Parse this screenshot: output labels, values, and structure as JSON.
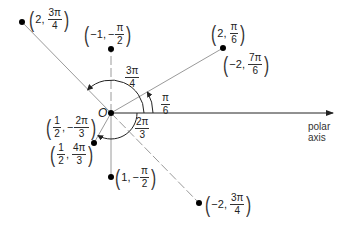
{
  "diagram": {
    "title": "",
    "origin_label": "O",
    "axis_label_line1": "polar",
    "axis_label_line2": "axis",
    "colors": {
      "line": "#9a9a9a",
      "axis": "#222222",
      "point": "#000000",
      "text": "#222222"
    },
    "scale_px_per_unit": 64,
    "points": [
      {
        "id": "p1",
        "r": "2",
        "theta_num": "3π",
        "theta_den": "4",
        "sign": "",
        "polar": [
          2,
          2.356
        ]
      },
      {
        "id": "p2",
        "r": "−1",
        "theta_num": "π",
        "theta_den": "2",
        "sign": "−",
        "polar": [
          -1,
          -1.571
        ]
      },
      {
        "id": "p3",
        "r": "2",
        "theta_num": "π",
        "theta_den": "6",
        "sign": "",
        "polar": [
          2,
          0.524
        ]
      },
      {
        "id": "p3b",
        "r": "−2",
        "theta_num": "7π",
        "theta_den": "6",
        "sign": "",
        "polar": [
          -2,
          3.665
        ]
      },
      {
        "id": "p4",
        "r_num": "1",
        "r_den": "2",
        "theta_num": "2π",
        "theta_den": "3",
        "sign": "−",
        "polar": [
          0.5,
          -2.094
        ]
      },
      {
        "id": "p4b",
        "r_num": "1",
        "r_den": "2",
        "theta_num": "4π",
        "theta_den": "3",
        "sign": "",
        "polar": [
          0.5,
          4.189
        ]
      },
      {
        "id": "p5",
        "r": "1",
        "theta_num": "π",
        "theta_den": "2",
        "sign": "−",
        "polar": [
          1,
          -1.571
        ]
      },
      {
        "id": "p6",
        "r": "−2",
        "theta_num": "3π",
        "theta_den": "4",
        "sign": "",
        "polar": [
          -2,
          2.356
        ]
      }
    ],
    "angle_labels": [
      {
        "id": "a34",
        "num": "3π",
        "den": "4"
      },
      {
        "id": "a6",
        "num": "π",
        "den": "6"
      },
      {
        "id": "a23",
        "num": "2π",
        "den": "3"
      }
    ],
    "comma": ","
  }
}
